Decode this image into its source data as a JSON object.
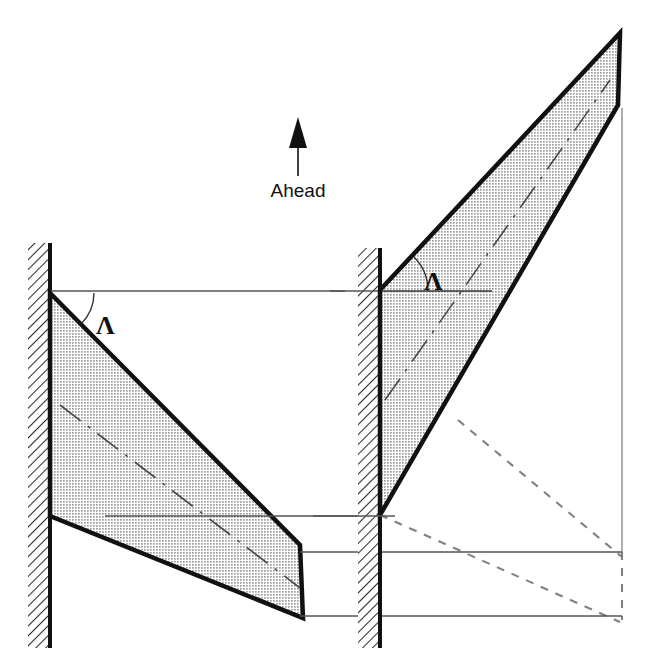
{
  "figure": {
    "background_color": "#ffffff",
    "direction_indicator": {
      "label": "Ahead",
      "arrow_name": "ahead-arrow",
      "arrow_direction": "up",
      "arrow_tip": [
        298,
        118
      ],
      "arrow_tail": [
        298,
        176
      ],
      "label_position": [
        298,
        196
      ],
      "color": "#111111"
    },
    "angle_symbol_left": {
      "label": "Λ",
      "name": "sweep-angle-lambda-left",
      "position": [
        104,
        323
      ],
      "arc_center": [
        50,
        293
      ],
      "arc_radius": 44,
      "color": "#111111"
    },
    "angle_symbol_right": {
      "label": "Λ",
      "name": "sweep-angle-lambda-right",
      "position": [
        434,
        280
      ],
      "arc_center": [
        380,
        291
      ],
      "arc_radius": 48,
      "color": "#111111"
    },
    "colors": {
      "outline": "#111111",
      "wing_fill": "#c9c9c9",
      "wall_hatch": "#2b2b2b",
      "reference_line": "#555555",
      "dashed_projection": "#777777",
      "centerline": "#4a4a4a"
    },
    "left_panel": {
      "name": "left-wing-assembly",
      "caption": "swept-back planform",
      "wall": {
        "name": "left-fuselage-wall",
        "hatch_x_start": 28,
        "hatch_x_end": 48,
        "y_top": 243,
        "y_bottom": 648,
        "edge_x": 50
      },
      "wing": {
        "name": "left-wing-planform",
        "points": "50,293 300,545 303,618 50,516",
        "root_leading_edge": [
          50,
          293
        ],
        "root_trailing_edge": [
          50,
          516
        ],
        "tip_leading_edge": [
          300,
          545
        ],
        "tip_trailing_edge": [
          303,
          618
        ]
      },
      "centerline": {
        "name": "left-wing-quarter-chord-centerline",
        "from": [
          60,
          405
        ],
        "to": [
          300,
          588
        ]
      },
      "reference_lines": [
        {
          "name": "left-root-chord-reference-line",
          "x1": 50,
          "y1": 291,
          "x2": 345,
          "y2": 291
        },
        {
          "name": "left-tip-leading-reference-line",
          "x1": 40,
          "y1": 516,
          "x2": 365,
          "y2": 516
        }
      ]
    },
    "right_panel": {
      "name": "right-wing-assembly",
      "caption": "swept-forward planform with mirrored projection",
      "wall": {
        "name": "right-fuselage-wall",
        "hatch_x_start": 358,
        "hatch_x_end": 378,
        "y_top": 248,
        "y_bottom": 648,
        "edge_x": 380
      },
      "wing": {
        "name": "right-wing-planform",
        "points": "380,290 620,33 618,105 380,515",
        "root_leading_edge": [
          380,
          290
        ],
        "root_trailing_edge": [
          380,
          515
        ],
        "tip_leading_edge": [
          620,
          33
        ],
        "tip_trailing_edge": [
          618,
          105
        ]
      },
      "centerline": {
        "name": "right-wing-quarter-chord-centerline",
        "from": [
          385,
          400
        ],
        "to": [
          610,
          80
        ]
      },
      "projection": {
        "name": "mirrored-wing-projection",
        "style": "dashed",
        "leading_edge": {
          "from": [
            380,
            515
          ],
          "to": [
            620,
            622
          ]
        },
        "trailing_edge": {
          "from": [
            458,
            420
          ],
          "to": [
            622,
            557
          ]
        },
        "tip_chord": {
          "from": [
            622,
            557
          ],
          "to": [
            622,
            622
          ]
        }
      },
      "reference_lines": [
        {
          "name": "right-root-chord-reference-line",
          "x1": 330,
          "y1": 291,
          "x2": 392,
          "y2": 291
        },
        {
          "name": "right-wall-base-reference-line",
          "x1": 313,
          "y1": 516,
          "x2": 395,
          "y2": 516
        },
        {
          "name": "mirror-upper-reference-line",
          "x1": 300,
          "y1": 552,
          "x2": 622,
          "y2": 552
        },
        {
          "name": "mirror-lower-reference-line",
          "x1": 300,
          "y1": 616,
          "x2": 622,
          "y2": 616
        },
        {
          "name": "tip-vertical-reference-line",
          "x1": 622,
          "y1": 108,
          "x2": 622,
          "y2": 552
        }
      ]
    }
  }
}
